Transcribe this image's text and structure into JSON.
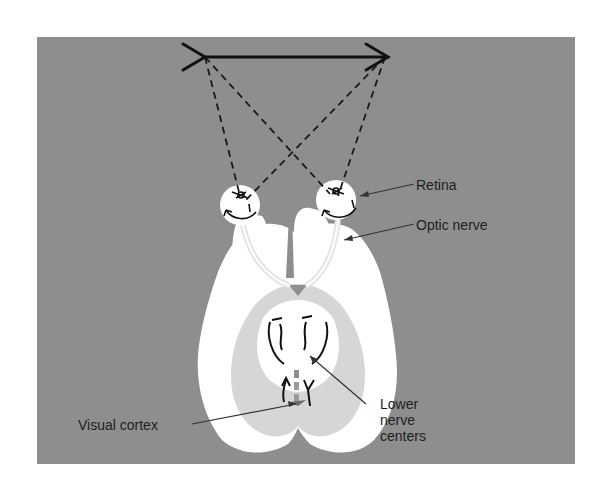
{
  "figure": {
    "type": "anatomical-diagram",
    "background_color": "#8e8e8e",
    "brain_color": "#ffffff",
    "inner_region_color": "#d6d6d6"
  },
  "labels": {
    "retina": "Retina",
    "optic_nerve": "Optic nerve",
    "visual_cortex": "Visual cortex",
    "lower_nerve_centers_line1": "Lower",
    "lower_nerve_centers_line2": "nerve",
    "lower_nerve_centers_line3": "centers"
  },
  "elements": {
    "object_arrow": "object-arrow",
    "light_rays": "dashed-ray-lines",
    "eyes": [
      "left-eye",
      "right-eye"
    ]
  }
}
